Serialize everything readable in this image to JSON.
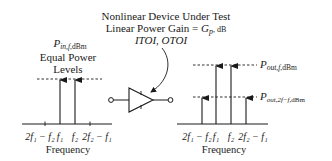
{
  "title": {
    "line1": "Nonlinear Device Under Test",
    "line2_prefix": "Linear Power Gain = ",
    "line2_symbol": "G",
    "line2_sub": "p",
    "line2_unit": ", dB",
    "line3": "ITOI, OTOI"
  },
  "input_spectrum": {
    "power_label_symbol": "P",
    "power_label_sub": "in,f",
    "power_label_unit": ",dBm",
    "note_line1": "Equal Power",
    "note_line2": "Levels",
    "tick_labels": [
      "2f₁ − f₂",
      "f₁",
      "f₂",
      "2f₂ − f₁"
    ],
    "x_label": "Frequency"
  },
  "output_spectrum": {
    "fund_label_symbol": "P",
    "fund_label_sub": "out,f",
    "fund_label_unit": ",dBm",
    "im_label_symbol": "P",
    "im_label_sub": "out,2f−f",
    "im_label_unit": ",dBm",
    "tick_labels": [
      "2f₁ − f₂",
      "f₁",
      "f₂",
      "2f₂ − f₁"
    ],
    "x_label": "Frequency"
  },
  "colors": {
    "ink": "#1a1a1a",
    "background": "#ffffff"
  }
}
